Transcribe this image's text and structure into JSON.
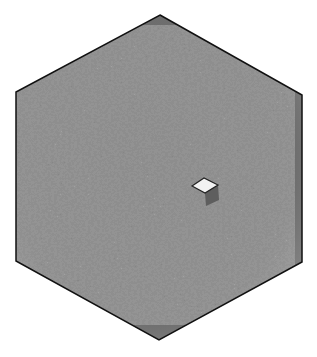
{
  "figure": {
    "width": 317,
    "height": 357,
    "background": "#ffffff",
    "hexagon": {
      "points": [
        [
          160,
          15
        ],
        [
          302,
          95
        ],
        [
          302,
          262
        ],
        [
          159,
          340
        ],
        [
          16,
          261
        ],
        [
          16,
          92
        ]
      ],
      "fill": "#6e6e6e",
      "edge_fill": "#808080",
      "stroke": "#111111"
    },
    "diamond": {
      "points": [
        [
          192,
          186
        ],
        [
          204,
          178
        ],
        [
          218,
          185
        ],
        [
          205,
          193
        ]
      ],
      "fill": "#f2f2f2",
      "stroke": "#222222",
      "shadow_fill": "#5a5a5a"
    },
    "texture": {
      "description": "rough random lattice surface",
      "dark": "#5c5c5c",
      "light": "#9a9a9a"
    }
  }
}
